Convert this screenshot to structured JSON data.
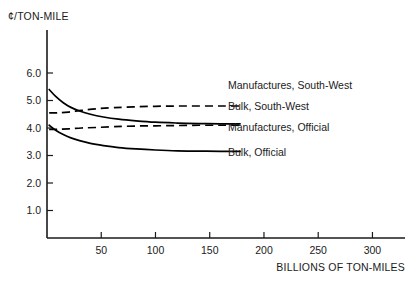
{
  "chart_data": {
    "type": "line",
    "title": "",
    "xlabel": "BILLIONS OF TON-MILES",
    "ylabel": "¢/TON-MILE",
    "xlim": [
      0,
      330
    ],
    "ylim": [
      0,
      6.6
    ],
    "xticks": [
      50,
      100,
      150,
      200,
      250,
      300
    ],
    "yticks": [
      1.0,
      2.0,
      3.0,
      4.0,
      5.0,
      6.0
    ],
    "ytick_labels": [
      "1.0",
      "2.0",
      "3.0",
      "4.0",
      "5.0",
      "6.0"
    ],
    "xtick_labels": [
      "50",
      "100",
      "150",
      "200",
      "250",
      "300"
    ],
    "grid": false,
    "legend_position": "inline-right-of-curves",
    "series": [
      {
        "name": "Manufactures, Official",
        "style": "solid",
        "color": "#000000",
        "x": [
          2,
          8,
          15,
          22,
          30,
          40,
          52,
          66,
          82,
          100,
          120,
          140,
          160,
          178
        ],
        "values": [
          5.4,
          5.15,
          4.92,
          4.75,
          4.62,
          4.5,
          4.4,
          4.32,
          4.26,
          4.21,
          4.18,
          4.16,
          4.15,
          4.15
        ]
      },
      {
        "name": "Manufactures, South-West",
        "style": "dashed",
        "color": "#000000",
        "x": [
          2,
          10,
          20,
          32,
          46,
          62,
          80,
          100,
          120,
          140,
          160,
          178
        ],
        "values": [
          4.55,
          4.55,
          4.58,
          4.64,
          4.7,
          4.74,
          4.77,
          4.79,
          4.8,
          4.8,
          4.8,
          4.8
        ]
      },
      {
        "name": "Bulk, Official",
        "style": "solid",
        "color": "#000000",
        "x": [
          2,
          8,
          15,
          22,
          30,
          40,
          52,
          66,
          82,
          100,
          120,
          140,
          160,
          178
        ],
        "values": [
          4.1,
          3.92,
          3.76,
          3.64,
          3.54,
          3.44,
          3.36,
          3.29,
          3.24,
          3.2,
          3.17,
          3.16,
          3.15,
          3.15
        ]
      },
      {
        "name": "Bulk, South-West",
        "style": "dashed",
        "color": "#000000",
        "x": [
          2,
          10,
          20,
          32,
          46,
          62,
          80,
          100,
          120,
          140,
          160,
          178
        ],
        "values": [
          3.95,
          3.95,
          3.97,
          4.0,
          4.02,
          4.05,
          4.07,
          4.08,
          4.09,
          4.1,
          4.1,
          4.1
        ]
      }
    ],
    "annotations": [
      {
        "text": "Manufactures, South-West",
        "series": "Manufactures, South-West"
      },
      {
        "text": "Bulk, South-West",
        "series": "Bulk, South-West"
      },
      {
        "text": "Manufactures, Official",
        "series": "Manufactures, Official"
      },
      {
        "text": "Bulk, Official",
        "series": "Bulk, Official"
      }
    ]
  }
}
